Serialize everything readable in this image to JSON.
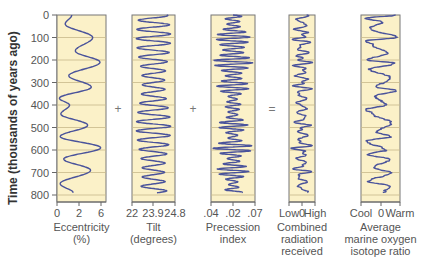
{
  "chart_data": {
    "type": "line",
    "title": "",
    "ylabel": "Time (thousands of years ago)",
    "y_ticks": [
      0,
      100,
      200,
      300,
      400,
      500,
      600,
      700,
      800
    ],
    "ylim": [
      0,
      800
    ],
    "y_inverted": true,
    "grid": true,
    "panels": [
      {
        "id": "eccentricity",
        "xlabel": "Eccentricity (%)",
        "xlabel_lines": [
          "Eccentricity",
          "(%)"
        ],
        "x_ticks": [
          "0",
          "2",
          "6"
        ],
        "operator_after": "+",
        "series": {
          "time": [
            0,
            40,
            100,
            160,
            210,
            270,
            320,
            370,
            400,
            440,
            490,
            540,
            590,
            640,
            690,
            750,
            790
          ],
          "values": [
            1.9,
            1.0,
            4.8,
            2.4,
            5.8,
            1.5,
            4.6,
            0.2,
            1.6,
            0.4,
            4.1,
            0.3,
            5.9,
            0.8,
            4.5,
            0.3,
            2.1
          ]
        }
      },
      {
        "id": "tilt",
        "xlabel": "Tilt (degrees)",
        "xlabel_lines": [
          "Tilt",
          "(degrees)"
        ],
        "x_ticks": [
          "22",
          "23.9",
          "24.8"
        ],
        "operator_after": "+",
        "series": {
          "period_kyr": 41,
          "min": 22.3,
          "max": 24.5
        }
      },
      {
        "id": "precession",
        "xlabel": "Precession index",
        "xlabel_lines": [
          "Precession",
          "index"
        ],
        "x_ticks": [
          ".04",
          ".02",
          ".07"
        ],
        "operator_after": "=",
        "series": {
          "period_kyr": 23,
          "amplitude_modulated_by": "eccentricity"
        }
      },
      {
        "id": "radiation",
        "xlabel": "Combined radiation received",
        "xlabel_lines": [
          "Combined",
          "radiation",
          "received"
        ],
        "x_ticks": [
          "Low",
          "0",
          "High"
        ],
        "operator_after": "",
        "series": {
          "description": "sum of orbital components"
        }
      },
      {
        "id": "isotope",
        "xlabel": "Average marine oxygen isotope ratio",
        "xlabel_lines": [
          "Average",
          "marine oxygen",
          "isotope ratio"
        ],
        "x_ticks": [
          "Cool",
          "0",
          "Warm"
        ],
        "operator_after": "",
        "series": {
          "time": [
            0,
            15,
            30,
            60,
            100,
            115,
            130,
            170,
            200,
            215,
            240,
            280,
            320,
            335,
            360,
            400,
            420,
            440,
            480,
            520,
            540,
            560,
            600,
            620,
            640,
            680,
            700,
            740,
            760,
            790
          ],
          "values": [
            0.9,
            -0.9,
            0.1,
            -0.6,
            0.9,
            -0.8,
            -0.5,
            0.4,
            -0.7,
            0.8,
            -0.6,
            0.6,
            -0.2,
            0.9,
            -0.3,
            0.3,
            -0.8,
            -0.4,
            0.6,
            -0.2,
            0.6,
            -0.8,
            0.3,
            -0.7,
            0.5,
            -0.4,
            0.6,
            -0.7,
            0.5,
            0.2
          ]
        }
      }
    ]
  },
  "axis": {
    "ylabel": "Time (thousands of years ago)",
    "y_tick_labels": [
      "0",
      "100",
      "200",
      "300",
      "400",
      "500",
      "600",
      "700",
      "800"
    ]
  },
  "operators": [
    "+",
    "+",
    "="
  ],
  "colors": {
    "panel_bg": "#fbf1c8",
    "panel_border": "#777777",
    "grid": "#c8b98a",
    "curve": "#4a539b",
    "text": "#555555"
  }
}
